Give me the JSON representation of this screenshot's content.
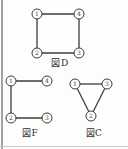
{
  "page": {
    "background": "#fdfdfc"
  },
  "frame": {
    "left_border_color": "#9da2a6",
    "bottom_border_color": "#c8c8c6"
  },
  "diagram": {
    "stroke_color": "#3c3c3c",
    "node_fill": "#ffffff",
    "node_radius": 5,
    "edge_width": 1.3,
    "node_stroke_width": 1,
    "figures": [
      {
        "name": "figure-D",
        "caption": "図D",
        "caption_x": 60,
        "caption_y": 66,
        "nodes": [
          {
            "id": "1",
            "x": 37,
            "y": 14
          },
          {
            "id": "4",
            "x": 79,
            "y": 14
          },
          {
            "id": "2",
            "x": 37,
            "y": 53
          },
          {
            "id": "3",
            "x": 79,
            "y": 53
          }
        ],
        "edges": [
          [
            "1",
            "4"
          ],
          [
            "4",
            "3"
          ],
          [
            "3",
            "2"
          ],
          [
            "2",
            "1"
          ]
        ]
      },
      {
        "name": "figure-F",
        "caption": "図F",
        "caption_x": 30,
        "caption_y": 136,
        "nodes": [
          {
            "id": "1",
            "x": 11,
            "y": 81
          },
          {
            "id": "4",
            "x": 47,
            "y": 81
          },
          {
            "id": "2",
            "x": 11,
            "y": 118
          },
          {
            "id": "3",
            "x": 47,
            "y": 118
          }
        ],
        "edges": [
          [
            "1",
            "4"
          ],
          [
            "1",
            "2"
          ],
          [
            "2",
            "3"
          ]
        ]
      },
      {
        "name": "figure-C",
        "caption": "図C",
        "caption_x": 94,
        "caption_y": 136,
        "nodes": [
          {
            "id": "1",
            "x": 75,
            "y": 84
          },
          {
            "id": "3",
            "x": 107,
            "y": 84
          },
          {
            "id": "2",
            "x": 91,
            "y": 116
          }
        ],
        "edges": [
          [
            "1",
            "3"
          ],
          [
            "1",
            "2"
          ],
          [
            "3",
            "2"
          ]
        ]
      }
    ]
  }
}
